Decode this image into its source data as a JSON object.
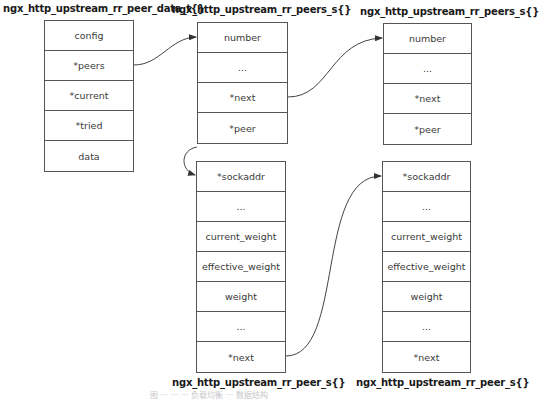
{
  "structs": [
    {
      "id": "peer_data",
      "title": "ngx_http_upstream_rr_peer_data_t{}",
      "fields": [
        "config",
        "*peers",
        "*current",
        "*tried",
        "data"
      ]
    },
    {
      "id": "peers_1",
      "title": "ngx_http_upstream_rr_peers_s{}",
      "fields": [
        "number",
        "...",
        "*next",
        "*peer"
      ]
    },
    {
      "id": "peers_2",
      "title": "ngx_http_upstream_rr_peers_s{}",
      "fields": [
        "number",
        "...",
        "*next",
        "*peer"
      ]
    },
    {
      "id": "peer_1",
      "title": "ngx_http_upstream_rr_peer_s{}",
      "fields": [
        "*sockaddr",
        "...",
        "current_weight",
        "effective_weight",
        "weight",
        "...",
        "*next"
      ]
    },
    {
      "id": "peer_2",
      "title": "ngx_http_upstream_rr_peer_s{}",
      "fields": [
        "*sockaddr",
        "...",
        "current_weight",
        "effective_weight",
        "weight",
        "...",
        "*next"
      ]
    }
  ],
  "links": [
    {
      "from": "peer_data.*peers",
      "to": "peers_1.number"
    },
    {
      "from": "peers_1.*next",
      "to": "peers_2.number"
    },
    {
      "from": "peers_1.*peer",
      "to": "peer_1.*sockaddr"
    },
    {
      "from": "peer_1.*next",
      "to": "peer_2.*sockaddr"
    }
  ],
  "caption": "图 ··· ··· ··· 负载均衡 ··· 数据结构"
}
